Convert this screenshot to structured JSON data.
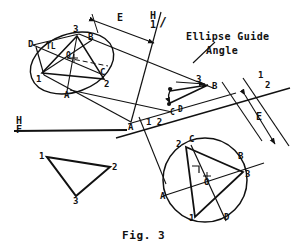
{
  "figure": {
    "caption": "Fig. 3",
    "note": {
      "line1": "Ellipse Guide",
      "line2": "Angle"
    },
    "fold_lines": {
      "h_f": {
        "top": "H",
        "bottom": "F"
      },
      "h_1": {
        "top": "H",
        "bottom": "1"
      },
      "one_two": {
        "top": "1",
        "bottom": "2"
      }
    },
    "dimensions": {
      "e_top": "E",
      "e_right": "E"
    },
    "top_view": {
      "true_length_label": "TL",
      "center_label": "O",
      "vertices": [
        "1",
        "2",
        "3"
      ],
      "points": [
        "A",
        "B",
        "C",
        "D"
      ],
      "vertex_1": "1",
      "vertex_2": "2",
      "vertex_3": "3",
      "point_a": "A",
      "point_b": "B",
      "point_c": "C",
      "point_d": "D"
    },
    "front_view": {
      "vertex_1": "1",
      "vertex_2": "2",
      "vertex_3": "3"
    },
    "edge_view": {
      "point_a": "A",
      "vertices_12": "1 2",
      "point_c": "C",
      "point_d": "D",
      "vertex_3": "3",
      "point_b": "B"
    },
    "aux_view": {
      "center_label": "O",
      "vertex_1": "1",
      "vertex_2": "2",
      "vertex_3": "3",
      "point_a": "A",
      "point_b": "B",
      "point_c": "C",
      "point_d": "D"
    },
    "colors": {
      "ink": "#111111",
      "paper": "#ffffff"
    }
  }
}
